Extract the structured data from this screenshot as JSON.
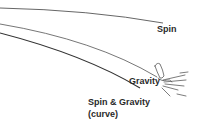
{
  "diagram": {
    "labels": {
      "spin": "Spin",
      "gravity": "Gravity",
      "spin_and_gravity": "Spin & Gravity",
      "curve_note": "(curve)"
    },
    "paths": [
      {
        "name": "spin",
        "d": "M0,8 Q90,10 163,23",
        "stroke": "#555555",
        "width": 0.9
      },
      {
        "name": "gravity",
        "d": "M0,24 Q95,40 157,77",
        "stroke": "#666666",
        "width": 0.9
      },
      {
        "name": "spin-and-gravity",
        "d": "M0,33 Q85,55 140,88",
        "stroke": "#333333",
        "width": 1.2
      }
    ],
    "colors": {
      "line_dark": "#333333",
      "line_mid": "#555555",
      "text": "#2a2a2a",
      "background": "#ffffff"
    }
  }
}
